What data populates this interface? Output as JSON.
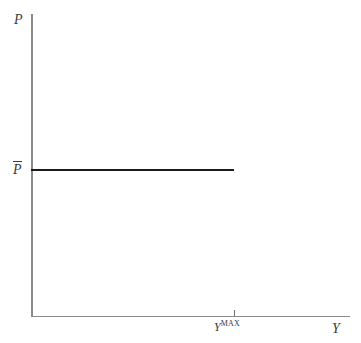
{
  "figure": {
    "background_color": "#ffffff",
    "axis_color": "#8a8a8a",
    "line_color": "#1a1a1a",
    "label_color": "#3b3b3b",
    "width": 361,
    "height": 343
  },
  "labels": {
    "y_axis_title": "P",
    "x_axis_title": "Y",
    "price_level": "P",
    "output_max_base": "Y",
    "output_max_sup": "MAX"
  },
  "chart_data": {
    "type": "line",
    "title": "",
    "xlabel": "Y",
    "ylabel": "P",
    "grid": false,
    "legend": null,
    "xlim": [
      0,
      1
    ],
    "ylim": [
      0,
      1
    ],
    "axis_ticks": {
      "x": [
        {
          "label_base": "Y",
          "label_sup": "MAX",
          "position": 0.636
        }
      ],
      "y": [
        {
          "label_base": "P",
          "overline": true,
          "position": 0.484
        }
      ]
    },
    "series": [
      {
        "name": "Keynesian aggregate supply",
        "shape": "horizontal-segment",
        "y_value_label": "P",
        "x_start": 0.0,
        "x_end": 0.636,
        "y": 0.484,
        "points": [
          {
            "x": 0.0,
            "y": 0.484
          },
          {
            "x": 0.636,
            "y": 0.484
          }
        ]
      }
    ],
    "annotations": []
  }
}
